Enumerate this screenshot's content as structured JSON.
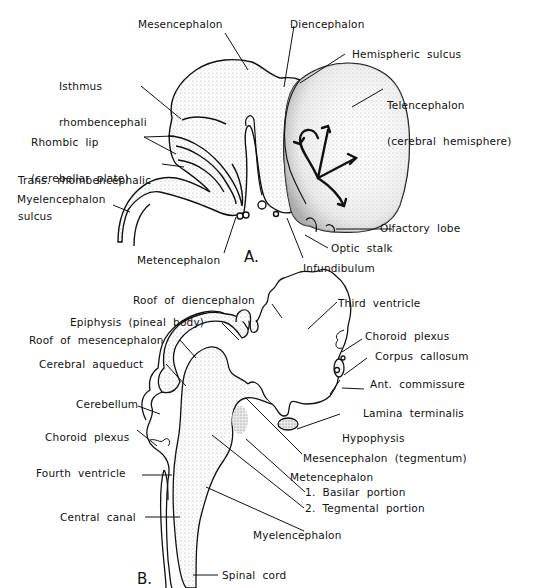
{
  "figure": {
    "panel_a": {
      "marker": "A.",
      "labels": [
        {
          "id": "mesencephalon",
          "text": "Mesencephalon"
        },
        {
          "id": "diencephalon",
          "text": "Diencephalon"
        },
        {
          "id": "hemispheric-sulcus",
          "text": "Hemispheric  sulcus"
        },
        {
          "id": "isthmus",
          "text": "Isthmus\nrhombencephali",
          "line1": "Isthmus",
          "line2": "rhombencephali"
        },
        {
          "id": "telencephalon",
          "line1": "Telencephalon",
          "line2": "(cerebral  hemisphere)"
        },
        {
          "id": "rhombic-lip",
          "line1": "Rhombic  lip",
          "line2": "(cerebellar  plate)"
        },
        {
          "id": "trans-rhombencephalic",
          "line1": "Trans.  rhombencephalic",
          "line2": "sulcus"
        },
        {
          "id": "myelencephalon",
          "text": "Myelencephalon"
        },
        {
          "id": "olfactory-lobe",
          "text": "Olfactory  lobe"
        },
        {
          "id": "metencephalon",
          "text": "Metencephalon"
        },
        {
          "id": "optic-stalk",
          "text": "Optic  stalk"
        },
        {
          "id": "infundibulum",
          "text": "Infundibulum"
        }
      ]
    },
    "panel_b": {
      "marker": "B.",
      "labels": [
        {
          "id": "roof-diencephalon",
          "text": "Roof  of  diencephalon"
        },
        {
          "id": "third-ventricle",
          "text": "Third  ventricle"
        },
        {
          "id": "epiphysis",
          "text": "Epiphysis  (pineal  body)"
        },
        {
          "id": "choroid-plexus-upper",
          "text": "Choroid  plexus"
        },
        {
          "id": "roof-mesencephalon",
          "text": "Roof  of  mesencephalon"
        },
        {
          "id": "corpus-callosum",
          "text": "Corpus  callosum"
        },
        {
          "id": "cerebral-aqueduct",
          "text": "Cerebral  aqueduct"
        },
        {
          "id": "ant-commissure",
          "text": "Ant.  commissure"
        },
        {
          "id": "cerebellum",
          "text": "Cerebellum"
        },
        {
          "id": "lamina-terminalis",
          "text": "Lamina  terminalis"
        },
        {
          "id": "choroid-plexus-lower",
          "text": "Choroid  plexus"
        },
        {
          "id": "hypophysis",
          "text": "Hypophysis"
        },
        {
          "id": "fourth-ventricle",
          "text": "Fourth  ventricle"
        },
        {
          "id": "mesencephalon-tegmentum",
          "text": "Mesencephalon  (tegmentum)"
        },
        {
          "id": "metencephalon",
          "text": "Metencephalon"
        },
        {
          "id": "basilar-portion",
          "text": "1.  Basilar  portion"
        },
        {
          "id": "tegmental-portion",
          "text": "2.  Tegmental  portion"
        },
        {
          "id": "central-canal",
          "text": "Central  canal"
        },
        {
          "id": "myelencephalon",
          "text": "Myelencephalon"
        },
        {
          "id": "spinal-cord",
          "text": "Spinal  cord"
        }
      ]
    }
  }
}
